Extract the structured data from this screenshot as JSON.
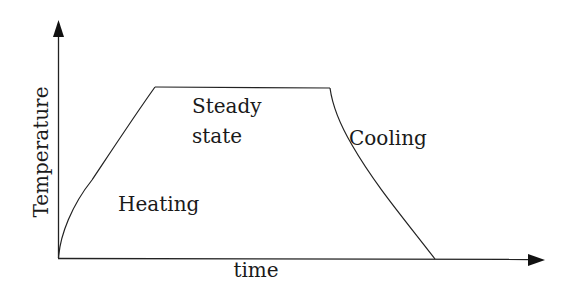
{
  "diagram": {
    "type": "temperature-time profile",
    "axes": {
      "x_label": "time",
      "y_label": "Temperature"
    },
    "phases": [
      {
        "name": "heating",
        "label": "Heating"
      },
      {
        "name": "steady-state",
        "label_line1": "Steady",
        "label_line2": "state"
      },
      {
        "name": "cooling",
        "label": "Cooling"
      }
    ],
    "colors": {
      "line": "#222222",
      "text": "#1a1a1a",
      "background": "#ffffff"
    }
  }
}
